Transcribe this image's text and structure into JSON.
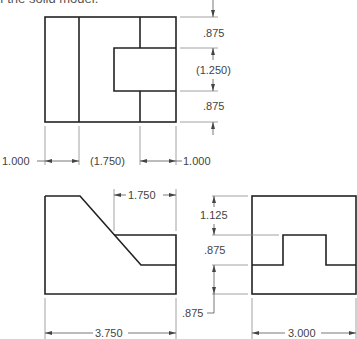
{
  "caption": "f the solid model.",
  "views": {
    "top": {
      "name": "Top view",
      "dims_right": [
        ".875",
        "(1.250)",
        ".875"
      ],
      "dims_bottom": [
        "1.000",
        "(1.750)",
        "1.000"
      ]
    },
    "front": {
      "name": "Front view",
      "dims": [
        "1.750",
        "3.750"
      ]
    },
    "side": {
      "name": "Right side view",
      "dims_left": [
        "1.125",
        ".875",
        ".875"
      ],
      "dims_bottom": [
        "3.000"
      ]
    }
  },
  "colors": {
    "object_line": "#222222",
    "dimension_line": "#555555",
    "text": "#444444"
  }
}
